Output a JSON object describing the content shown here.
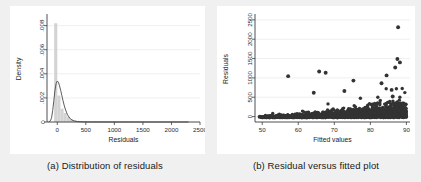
{
  "figure": {
    "background_color": "#f0f0f0",
    "panel_background": "#ffffff"
  },
  "panels": [
    {
      "id": "a",
      "caption": "(a) Distribution of residuals"
    },
    {
      "id": "b",
      "caption": "(b) Residual versus fitted plot"
    }
  ],
  "chart_data": [
    {
      "type": "bar",
      "title": "",
      "subtitle": "",
      "xlabel": "Residuals",
      "ylabel": "Density",
      "xlim": [
        -180,
        2500
      ],
      "ylim": [
        0,
        0.0088
      ],
      "xticks": [
        0,
        500,
        1000,
        1500,
        2000,
        2500
      ],
      "xticklabels": [
        "0",
        "500",
        "1000",
        "1500",
        "2000",
        "2500"
      ],
      "yticks": [
        0,
        0.002,
        0.004,
        0.006,
        0.008
      ],
      "yticklabels": [
        "0",
        ".002",
        ".004",
        ".006",
        ".008"
      ],
      "grid": true,
      "legend": "none",
      "bar_color": "#d3d3d3",
      "curve_color": "#4a4a4a",
      "bin_width": 55,
      "categories": [
        -27,
        28,
        83,
        138,
        193,
        248,
        303,
        358,
        413,
        468,
        523,
        578,
        633,
        688,
        743,
        798,
        853,
        908,
        963,
        1018
      ],
      "values": [
        0.0082,
        0.0022,
        0.0011,
        0.00075,
        0.00045,
        0.00022,
        0.00012,
        8e-05,
        5e-05,
        3e-05,
        2e-05,
        1.5e-05,
        1e-05,
        8e-06,
        6e-06,
        5e-06,
        4e-06,
        3e-06,
        2e-06,
        2e-06
      ],
      "series": [
        {
          "name": "Kernel density",
          "type": "line",
          "x": [
            -150,
            -120,
            -100,
            -80,
            -60,
            -40,
            -20,
            0,
            20,
            40,
            60,
            80,
            100,
            120,
            140,
            160,
            180,
            200,
            230,
            260,
            300,
            350,
            400,
            460,
            520,
            600,
            700,
            850,
            1000,
            1250,
            1500,
            1750,
            2000,
            2300
          ],
          "y": [
            2e-05,
            0.0001,
            0.00035,
            0.00095,
            0.0018,
            0.00265,
            0.0032,
            0.0034,
            0.0033,
            0.003,
            0.00262,
            0.0022,
            0.00178,
            0.0014,
            0.00108,
            0.00082,
            0.0006,
            0.00044,
            0.00026,
            0.00016,
            9e-05,
            4e-05,
            2e-05,
            1e-05,
            8e-06,
            6e-06,
            4e-06,
            3e-06,
            2e-06,
            2e-06,
            1e-06,
            1e-06,
            1e-06,
            1e-06
          ]
        }
      ]
    },
    {
      "type": "scatter",
      "title": "",
      "subtitle": "",
      "xlabel": "Fitted values",
      "ylabel": "Residuals",
      "xlim": [
        48,
        91
      ],
      "ylim": [
        -140,
        2600
      ],
      "xticks": [
        50,
        60,
        70,
        80,
        90
      ],
      "xticklabels": [
        "50",
        "60",
        "70",
        "80",
        "90"
      ],
      "yticks": [
        0,
        500,
        1000,
        1500,
        2000,
        2500
      ],
      "yticklabels": [
        "0",
        "500",
        "1000",
        "1500",
        "2000",
        "2500"
      ],
      "grid": true,
      "legend": "none",
      "marker_color": "#333333",
      "marker_size": 1.7,
      "notable_points": [
        {
          "x": 87.7,
          "y": 2310
        },
        {
          "x": 87.5,
          "y": 1490
        },
        {
          "x": 88.2,
          "y": 1400
        },
        {
          "x": 86.9,
          "y": 1270
        },
        {
          "x": 57.2,
          "y": 1045
        },
        {
          "x": 65.8,
          "y": 1165
        },
        {
          "x": 67.6,
          "y": 1135
        },
        {
          "x": 84.5,
          "y": 1065
        },
        {
          "x": 75.3,
          "y": 930
        },
        {
          "x": 83.1,
          "y": 860
        },
        {
          "x": 85.9,
          "y": 690
        },
        {
          "x": 86.2,
          "y": 520
        },
        {
          "x": 64.3,
          "y": 615
        },
        {
          "x": 72.8,
          "y": 660
        }
      ]
    }
  ]
}
